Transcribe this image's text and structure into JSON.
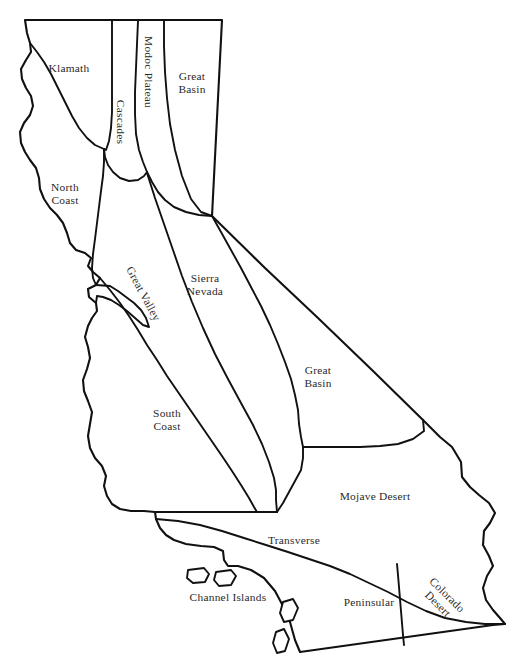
{
  "map": {
    "title": "California Geomorphic / Floristic Provinces",
    "background_color": "#ffffff",
    "line_color": "#111111",
    "label_color": "#2b2a28",
    "regions": [
      {
        "id": "klamath",
        "label": "Klamath",
        "x": 69,
        "y": 69,
        "rotation": 0,
        "align": "center"
      },
      {
        "id": "cascades",
        "label": "Cascades",
        "x": 120,
        "y": 122,
        "rotation": 90,
        "align": "center"
      },
      {
        "id": "modoc-plateau",
        "label": "Modoc Plateau",
        "x": 148,
        "y": 72,
        "rotation": 90,
        "align": "center"
      },
      {
        "id": "great-basin-n",
        "label": "Great\nBasin",
        "x": 192,
        "y": 83,
        "rotation": 0,
        "align": "center"
      },
      {
        "id": "north-coast",
        "label": "North\nCoast",
        "x": 65,
        "y": 194,
        "rotation": 0,
        "align": "center"
      },
      {
        "id": "great-valley",
        "label": "Great Valley",
        "x": 143,
        "y": 294,
        "rotation": 62,
        "align": "center"
      },
      {
        "id": "sierra-nevada",
        "label": "Sierra\nNevada",
        "x": 205,
        "y": 285,
        "rotation": 0,
        "align": "center"
      },
      {
        "id": "great-basin-s",
        "label": "Great\nBasin",
        "x": 318,
        "y": 377,
        "rotation": 0,
        "align": "center"
      },
      {
        "id": "south-coast",
        "label": "South\nCoast",
        "x": 167,
        "y": 420,
        "rotation": 0,
        "align": "center"
      },
      {
        "id": "mojave-desert",
        "label": "Mojave Desert",
        "x": 375,
        "y": 497,
        "rotation": 0,
        "align": "center"
      },
      {
        "id": "transverse",
        "label": "Transverse",
        "x": 294,
        "y": 541,
        "rotation": 0,
        "align": "center"
      },
      {
        "id": "channel-islands",
        "label": "Channel Islands",
        "x": 228,
        "y": 598,
        "rotation": 0,
        "align": "center"
      },
      {
        "id": "peninsular",
        "label": "Peninsular",
        "x": 369,
        "y": 603,
        "rotation": 0,
        "align": "center"
      },
      {
        "id": "colorado-desert",
        "label": "Colorado\nDesert",
        "x": 442,
        "y": 600,
        "rotation": 45,
        "align": "center"
      }
    ],
    "islands": [
      {
        "id": "island-1",
        "name": "channel-island-northwest"
      },
      {
        "id": "island-2",
        "name": "channel-island-north"
      },
      {
        "id": "island-3",
        "name": "channel-island-center"
      },
      {
        "id": "island-4",
        "name": "channel-island-south"
      }
    ]
  }
}
